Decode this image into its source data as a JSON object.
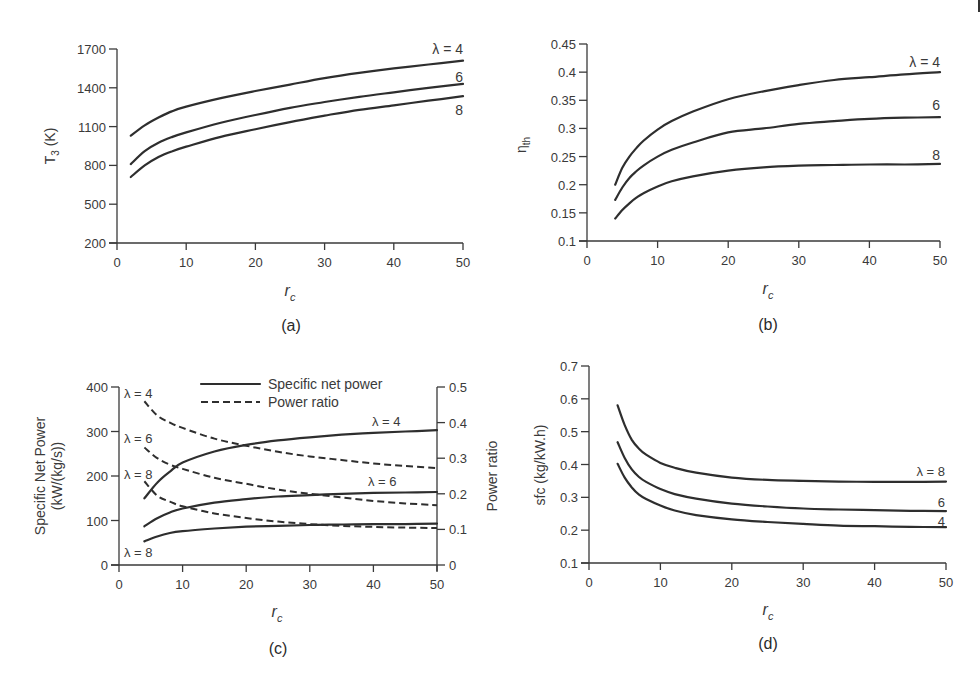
{
  "chart_data": [
    {
      "panel": "(a)",
      "type": "line",
      "title": "",
      "xlabel": "r_c",
      "ylabel": "T3 (K)",
      "xlim": [
        0,
        50
      ],
      "ylim": [
        200,
        1700
      ],
      "xticks": [
        0,
        10,
        20,
        30,
        40,
        50
      ],
      "yticks": [
        200,
        500,
        800,
        1100,
        1400,
        1700
      ],
      "grid": false,
      "series": [
        {
          "name": "λ = 4",
          "label": "λ = 4",
          "x": [
            2,
            4,
            6,
            8,
            10,
            15,
            20,
            25,
            30,
            35,
            40,
            45,
            50
          ],
          "values": [
            1030,
            1110,
            1170,
            1220,
            1255,
            1320,
            1375,
            1425,
            1475,
            1515,
            1550,
            1580,
            1610
          ]
        },
        {
          "name": "λ = 6",
          "label": "6",
          "x": [
            2,
            4,
            6,
            8,
            10,
            15,
            20,
            25,
            30,
            35,
            40,
            45,
            50
          ],
          "values": [
            810,
            910,
            975,
            1020,
            1055,
            1130,
            1190,
            1245,
            1290,
            1330,
            1365,
            1400,
            1430
          ]
        },
        {
          "name": "λ = 8",
          "label": "8",
          "x": [
            2,
            4,
            6,
            8,
            10,
            15,
            20,
            25,
            30,
            35,
            40,
            45,
            50
          ],
          "values": [
            710,
            800,
            865,
            910,
            945,
            1020,
            1080,
            1135,
            1185,
            1230,
            1265,
            1300,
            1335
          ]
        }
      ]
    },
    {
      "panel": "(b)",
      "type": "line",
      "title": "",
      "xlabel": "r_c",
      "ylabel": "η_th",
      "xlim": [
        0,
        50
      ],
      "ylim": [
        0.1,
        0.45
      ],
      "xticks": [
        0,
        10,
        20,
        30,
        40,
        50
      ],
      "yticks": [
        0.1,
        0.15,
        0.2,
        0.25,
        0.3,
        0.35,
        0.4,
        0.45
      ],
      "grid": false,
      "series": [
        {
          "name": "λ = 4",
          "label": "λ = 4",
          "x": [
            4,
            5,
            6,
            7,
            8,
            10,
            12,
            15,
            20,
            25,
            30,
            35,
            40,
            45,
            50
          ],
          "values": [
            0.2,
            0.23,
            0.25,
            0.265,
            0.278,
            0.298,
            0.313,
            0.33,
            0.352,
            0.366,
            0.377,
            0.386,
            0.391,
            0.396,
            0.4
          ]
        },
        {
          "name": "λ = 6",
          "label": "6",
          "x": [
            4,
            5,
            6,
            7,
            8,
            10,
            12,
            15,
            20,
            25,
            30,
            35,
            40,
            45,
            50
          ],
          "values": [
            0.173,
            0.195,
            0.212,
            0.224,
            0.234,
            0.25,
            0.262,
            0.275,
            0.293,
            0.3,
            0.308,
            0.313,
            0.317,
            0.319,
            0.32
          ]
        },
        {
          "name": "λ = 8",
          "label": "8",
          "x": [
            4,
            5,
            6,
            7,
            8,
            10,
            12,
            15,
            20,
            25,
            30,
            35,
            40,
            45,
            50
          ],
          "values": [
            0.14,
            0.155,
            0.167,
            0.177,
            0.185,
            0.197,
            0.206,
            0.215,
            0.225,
            0.231,
            0.234,
            0.235,
            0.236,
            0.236,
            0.237
          ]
        }
      ]
    },
    {
      "panel": "(c)",
      "type": "line",
      "title": "",
      "xlabel": "r_c",
      "ylabel": "Specific Net Power (kW/(kg/s))",
      "y2label": "Power ratio",
      "xlim": [
        0,
        50
      ],
      "ylim": [
        0,
        400
      ],
      "y2lim": [
        0,
        0.5
      ],
      "xticks": [
        0,
        10,
        20,
        30,
        40,
        50
      ],
      "yticks": [
        0,
        100,
        200,
        300,
        400
      ],
      "y2ticks": [
        0,
        0.1,
        0.2,
        0.3,
        0.4,
        0.5
      ],
      "grid": false,
      "legend": {
        "position": "top-center",
        "entries": [
          {
            "label": "Specific net power",
            "style": "solid"
          },
          {
            "label": "Power ratio",
            "style": "dashed"
          }
        ]
      },
      "series": [
        {
          "name": "Specific net power λ = 4",
          "axis": "left",
          "style": "solid",
          "label": "λ = 4",
          "x": [
            4,
            6,
            8,
            10,
            15,
            20,
            25,
            30,
            35,
            40,
            45,
            50
          ],
          "values": [
            150,
            185,
            210,
            230,
            255,
            270,
            280,
            287,
            293,
            297,
            300,
            303
          ]
        },
        {
          "name": "Specific net power λ = 6",
          "axis": "left",
          "style": "solid",
          "label": "λ = 6",
          "x": [
            4,
            6,
            8,
            10,
            15,
            20,
            25,
            30,
            35,
            40,
            45,
            50
          ],
          "values": [
            87,
            105,
            118,
            127,
            140,
            148,
            154,
            157,
            160,
            162,
            163,
            164
          ]
        },
        {
          "name": "Specific net power λ = 8",
          "axis": "left",
          "style": "solid",
          "label": "λ = 8",
          "x": [
            4,
            6,
            8,
            10,
            15,
            20,
            25,
            30,
            35,
            40,
            45,
            50
          ],
          "values": [
            53,
            64,
            72,
            76,
            82,
            86,
            88,
            90,
            91,
            92,
            92,
            93
          ]
        },
        {
          "name": "Power ratio λ = 4",
          "axis": "right",
          "style": "dashed",
          "label": "λ = 4",
          "x": [
            4,
            6,
            8,
            10,
            15,
            20,
            25,
            30,
            35,
            40,
            45,
            50
          ],
          "values": [
            0.46,
            0.42,
            0.4,
            0.385,
            0.355,
            0.335,
            0.318,
            0.305,
            0.295,
            0.285,
            0.278,
            0.272
          ]
        },
        {
          "name": "Power ratio λ = 6",
          "axis": "right",
          "style": "dashed",
          "label": "λ = 6",
          "x": [
            4,
            6,
            8,
            10,
            15,
            20,
            25,
            30,
            35,
            40,
            45,
            50
          ],
          "values": [
            0.33,
            0.3,
            0.282,
            0.27,
            0.245,
            0.228,
            0.212,
            0.2,
            0.19,
            0.18,
            0.173,
            0.168
          ]
        },
        {
          "name": "Power ratio λ = 8",
          "axis": "right",
          "style": "dashed",
          "label": "λ = 8",
          "x": [
            4,
            6,
            8,
            10,
            15,
            20,
            25,
            30,
            35,
            40,
            45,
            50
          ],
          "values": [
            0.235,
            0.195,
            0.178,
            0.165,
            0.145,
            0.132,
            0.122,
            0.115,
            0.11,
            0.107,
            0.105,
            0.104
          ]
        }
      ]
    },
    {
      "panel": "(d)",
      "type": "line",
      "title": "",
      "xlabel": "r_c",
      "ylabel": "sfc (kg/kW.h)",
      "xlim": [
        0,
        50
      ],
      "ylim": [
        0.1,
        0.7
      ],
      "xticks": [
        0,
        10,
        20,
        30,
        40,
        50
      ],
      "yticks": [
        0.1,
        0.2,
        0.3,
        0.4,
        0.5,
        0.6,
        0.7
      ],
      "grid": false,
      "series": [
        {
          "name": "λ = 8",
          "label": "λ = 8",
          "x": [
            4,
            5,
            6,
            7,
            8,
            10,
            12,
            15,
            20,
            25,
            30,
            35,
            40,
            45,
            50
          ],
          "values": [
            0.58,
            0.52,
            0.475,
            0.448,
            0.43,
            0.405,
            0.39,
            0.375,
            0.36,
            0.353,
            0.35,
            0.348,
            0.347,
            0.347,
            0.348
          ]
        },
        {
          "name": "λ = 6",
          "label": "6",
          "x": [
            4,
            5,
            6,
            7,
            8,
            10,
            12,
            15,
            20,
            25,
            30,
            35,
            40,
            45,
            50
          ],
          "values": [
            0.468,
            0.42,
            0.385,
            0.362,
            0.347,
            0.325,
            0.31,
            0.296,
            0.281,
            0.272,
            0.266,
            0.263,
            0.261,
            0.259,
            0.258
          ]
        },
        {
          "name": "λ = 4",
          "label": "4",
          "x": [
            4,
            5,
            6,
            7,
            8,
            10,
            12,
            15,
            20,
            25,
            30,
            35,
            40,
            45,
            50
          ],
          "values": [
            0.402,
            0.36,
            0.33,
            0.308,
            0.295,
            0.275,
            0.26,
            0.246,
            0.233,
            0.225,
            0.219,
            0.214,
            0.212,
            0.21,
            0.209
          ]
        }
      ]
    }
  ],
  "labels": {
    "a": {
      "panel": "(a)",
      "xlabel": "r",
      "xsub": "c",
      "ylabel": "T",
      "ysub": "3",
      "yunit": " (K)",
      "curve_labels": [
        "λ = 4",
        "6",
        "8"
      ]
    },
    "b": {
      "panel": "(b)",
      "xlabel": "r",
      "xsub": "c",
      "ylabel": "η",
      "ysub": "th",
      "curve_labels": [
        "λ = 4",
        "6",
        "8"
      ]
    },
    "c": {
      "panel": "(c)",
      "xlabel": "r",
      "xsub": "c",
      "ylabel1": "Specific Net Power",
      "ylabel2": "(kW/(kg/s))",
      "y2label": "Power ratio",
      "legend_solid": "Specific net power",
      "legend_dashed": "Power ratio",
      "left_labels": [
        "λ = 4",
        "λ = 6",
        "λ = 8",
        "λ = 8"
      ],
      "right_labels": [
        "λ = 4",
        "λ = 6"
      ]
    },
    "d": {
      "panel": "(d)",
      "xlabel": "r",
      "xsub": "c",
      "ylabel": "sfc (kg/kW.h)",
      "curve_labels": [
        "λ = 8",
        "6",
        "4"
      ]
    }
  }
}
